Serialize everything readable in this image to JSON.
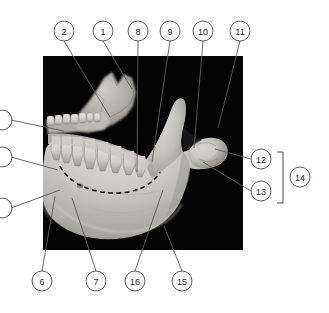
{
  "figure": {
    "kind": "anatomical-photograph-with-numbered-callouts",
    "background_color": "#ffffff",
    "photo": {
      "background_color": "#050505",
      "bone_color_light": "#e8e6e2",
      "bone_color_mid": "#bdbab4",
      "bone_color_dark": "#8d8a84",
      "x": 43,
      "y": 56,
      "width": 200,
      "height": 194
    },
    "line_color": "#5a5a5a",
    "circle_stroke_color": "#4a4a4a",
    "circle_fill_color": "#ffffff",
    "text_color": "#2b2b2b",
    "dashed_overlay_color": "#141414"
  },
  "callouts": {
    "top": [
      {
        "label": "2",
        "cx": 64,
        "cy": 31,
        "r": 10,
        "lx": 110,
        "ly": 117
      },
      {
        "label": "1",
        "cx": 103,
        "cy": 31,
        "r": 10,
        "lx": 132,
        "ly": 89
      },
      {
        "label": "8",
        "cx": 138,
        "cy": 31,
        "r": 10,
        "lx": 137,
        "ly": 172
      },
      {
        "label": "9",
        "cx": 170,
        "cy": 31,
        "r": 10,
        "lx": 152,
        "ly": 162
      },
      {
        "label": "10",
        "cx": 203,
        "cy": 31,
        "r": 10,
        "lx": 194,
        "ly": 148
      },
      {
        "label": "11",
        "cx": 240,
        "cy": 31,
        "r": 10,
        "lx": 218,
        "ly": 128
      }
    ],
    "bottom": [
      {
        "label": "6",
        "cx": 42,
        "cy": 281,
        "r": 10,
        "lx": 55,
        "ly": 196
      },
      {
        "label": "7",
        "cx": 96,
        "cy": 281,
        "r": 10,
        "lx": 72,
        "ly": 198
      },
      {
        "label": "16",
        "cx": 135,
        "cy": 281,
        "r": 10,
        "lx": 163,
        "ly": 190
      },
      {
        "label": "15",
        "cx": 182,
        "cy": 281,
        "r": 10,
        "lx": 164,
        "ly": 226
      }
    ],
    "right": [
      {
        "label": "12",
        "cx": 261,
        "cy": 159,
        "r": 10,
        "lx": 215,
        "ly": 149
      },
      {
        "label": "13",
        "cx": 261,
        "cy": 191,
        "r": 10,
        "lx": 203,
        "ly": 162
      }
    ],
    "grouped": {
      "label": "14",
      "cx": 300,
      "cy": 177,
      "r": 10
    },
    "left_partial": [
      {
        "cx": 2,
        "cy": 120,
        "r": 10,
        "lx": 64,
        "ly": 131
      },
      {
        "cx": 2,
        "cy": 157,
        "r": 10,
        "lx": 58,
        "ly": 170
      },
      {
        "cx": 2,
        "cy": 208,
        "r": 10,
        "lx": 60,
        "ly": 190
      }
    ]
  },
  "bracket": {
    "x": 283,
    "top_y": 152,
    "bottom_y": 203,
    "tip_length": 6
  }
}
